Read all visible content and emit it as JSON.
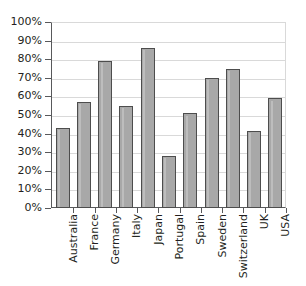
{
  "chart_data": {
    "type": "bar",
    "title": "",
    "subtitle": "",
    "xlabel": "",
    "ylabel": "",
    "ylim": [
      0,
      100
    ],
    "yunit": "%",
    "grid": true,
    "legend": false,
    "legend_position": "none",
    "orientation": "vertical",
    "bar_fill_color": "#a8a8a8",
    "bar_border_color": "#4d4d4d",
    "gridline_color": "#d9d9d9",
    "axis_color": "#58595b",
    "text_color": "#231f20",
    "categories": [
      "Australia",
      "France",
      "Germany",
      "Italy",
      "Japan",
      "Portugal",
      "Spain",
      "Sweden",
      "Switzerland",
      "UK",
      "USA"
    ],
    "values": [
      43,
      57,
      79,
      55,
      86,
      28,
      51,
      70,
      75,
      41.5,
      59
    ],
    "ytick_labels": [
      "0%",
      "10%",
      "20%",
      "30%",
      "40%",
      "50%",
      "60%",
      "70%",
      "80%",
      "90%",
      "100%"
    ],
    "ytick_values": [
      0,
      10,
      20,
      30,
      40,
      50,
      60,
      70,
      80,
      90,
      100
    ]
  }
}
